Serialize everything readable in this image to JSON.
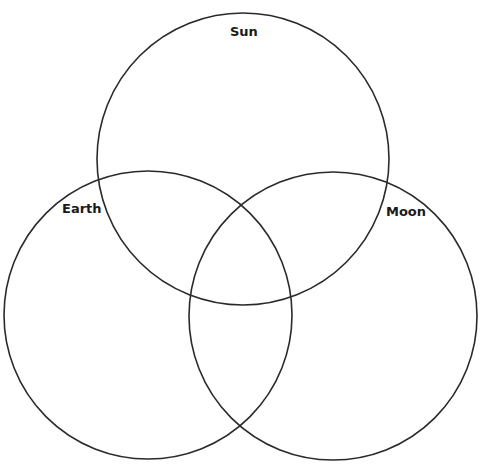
{
  "diagram": {
    "type": "venn",
    "stroke_color": "#2a2a2a",
    "background": "#ffffff",
    "sets": [
      {
        "id": "sun",
        "label": "Sun",
        "cx": 243,
        "cy": 159,
        "r": 146,
        "label_x": 230,
        "label_y": 25
      },
      {
        "id": "earth",
        "label": "Earth",
        "cx": 148,
        "cy": 315,
        "r": 144,
        "label_x": 62,
        "label_y": 202
      },
      {
        "id": "moon",
        "label": "Moon",
        "cx": 333,
        "cy": 316,
        "r": 144,
        "label_x": 386,
        "label_y": 205
      }
    ]
  }
}
